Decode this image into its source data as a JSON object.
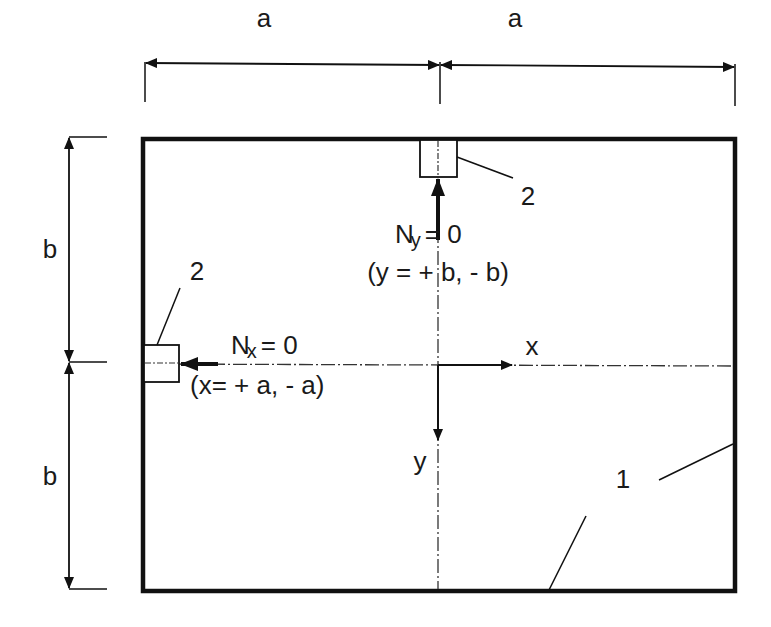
{
  "diagram": {
    "type": "plate-schematic",
    "colors": {
      "stroke": "#111111",
      "background": "#ffffff"
    },
    "dimensions": {
      "top_left_label": "a",
      "top_right_label": "a",
      "left_upper_label": "b",
      "left_lower_label": "b"
    },
    "axes": {
      "x_label": "x",
      "y_label": "y"
    },
    "annotations": {
      "ny_main": "N",
      "ny_sub": "y",
      "ny_eq": "= 0",
      "ny_condition": "(y = + b, - b)",
      "nx_main": "N",
      "nx_sub": "x",
      "nx_eq": "= 0",
      "nx_condition": "(x= + a, - a)"
    },
    "callouts": {
      "support_top": "2",
      "support_left": "2",
      "plate": "1"
    }
  }
}
